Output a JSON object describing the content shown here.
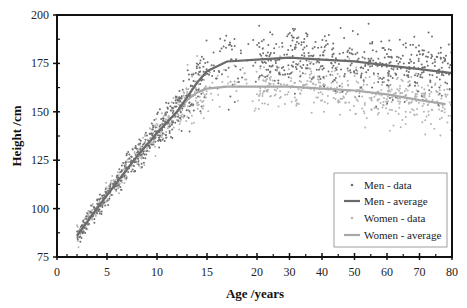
{
  "chart_data": {
    "type": "scatter",
    "title": "",
    "xlabel": "Age /years",
    "ylabel": "Height /cm",
    "xlim": [
      0,
      80
    ],
    "ylim": [
      75,
      200
    ],
    "x_scale": "piecewise: linear 0-20 (wide), linear 20-80 (compressed)",
    "x_ticks": [
      0,
      5,
      10,
      15,
      20,
      30,
      40,
      50,
      60,
      70,
      80
    ],
    "y_ticks": [
      75,
      100,
      125,
      150,
      175,
      200
    ],
    "grid": false,
    "legend_position": "lower right (inside)",
    "series": [
      {
        "name": "Men - data",
        "kind": "scatter",
        "color": "#6e6e6e",
        "description": "noisy points around men average, spread ~±10cm"
      },
      {
        "name": "Men - average",
        "kind": "line",
        "color": "#6a6a6a",
        "x": [
          2,
          5,
          8,
          10,
          12,
          14,
          15,
          17,
          20,
          30,
          40,
          50,
          60,
          70,
          80
        ],
        "y": [
          86,
          107,
          127,
          139,
          150,
          165,
          171,
          176,
          177,
          178,
          177,
          176,
          174,
          172,
          170
        ]
      },
      {
        "name": "Women - data",
        "kind": "scatter",
        "color": "#b4b4b4",
        "description": "noisy points around women average, spread ~±8cm"
      },
      {
        "name": "Women - average",
        "kind": "line",
        "color": "#a8a8a8",
        "x": [
          2,
          5,
          8,
          10,
          12,
          13,
          14,
          15,
          17,
          20,
          30,
          40,
          50,
          60,
          70,
          78
        ],
        "y": [
          86,
          107,
          127,
          139,
          150,
          156,
          160,
          162,
          163,
          163,
          163,
          162,
          161,
          159,
          156,
          154
        ]
      }
    ]
  },
  "legend": {
    "items": [
      {
        "label": "Men - data"
      },
      {
        "label": "Men - average"
      },
      {
        "label": "Women - data"
      },
      {
        "label": "Women - average"
      }
    ]
  },
  "axes": {
    "x_title": "Age /years",
    "y_title": "Height /cm"
  }
}
